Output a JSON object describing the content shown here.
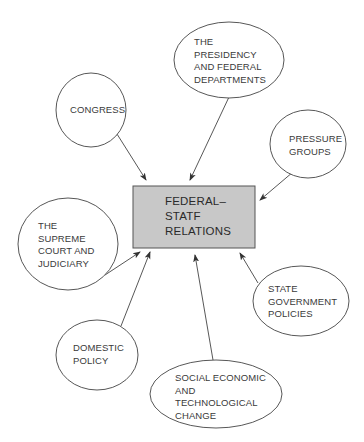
{
  "diagram": {
    "type": "concept-map",
    "center": {
      "label": "FEDERAL–\nSTATF\nRELATIONS",
      "fill": "#c8c8c8",
      "stroke": "#555555"
    },
    "nodes": [
      {
        "id": "congress",
        "label": "CONGRESS"
      },
      {
        "id": "presidency",
        "label": "THE\nPRESIDENCY\nAND FEDERAL\nDEPARTMENTS"
      },
      {
        "id": "pressure",
        "label": "PRESSURE\nGROUPS"
      },
      {
        "id": "judiciary",
        "label": "THE\nSUPREME\nCOURT AND\nJUDICIARY"
      },
      {
        "id": "state",
        "label": "STATE\nGOVERNMENT\nPOLICIES"
      },
      {
        "id": "domestic",
        "label": "DOMESTIC\nPOLICY"
      },
      {
        "id": "social",
        "label": "SOCIAL ECONOMIC\nAND\nTECHNOLOGICAL\nCHANGE"
      }
    ],
    "edges": [
      {
        "from": "congress",
        "to": "center"
      },
      {
        "from": "presidency",
        "to": "center"
      },
      {
        "from": "pressure",
        "to": "center"
      },
      {
        "from": "judiciary",
        "to": "center"
      },
      {
        "from": "state",
        "to": "center"
      },
      {
        "from": "domestic",
        "to": "center"
      },
      {
        "from": "social",
        "to": "center"
      }
    ],
    "colors": {
      "line": "#444444",
      "text": "#333333",
      "background": "#ffffff"
    }
  }
}
